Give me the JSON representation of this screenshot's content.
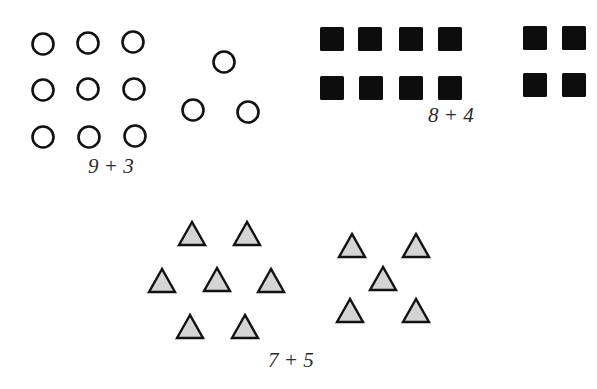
{
  "figure": {
    "groups": [
      {
        "id": "circles",
        "label": "9 + 3",
        "shape": "circle",
        "counts": [
          9,
          3
        ],
        "label_pos": [
          88,
          155
        ]
      },
      {
        "id": "squares",
        "label": "8 + 4",
        "shape": "square",
        "counts": [
          8,
          4
        ],
        "label_pos": [
          428,
          106
        ]
      },
      {
        "id": "triangles",
        "label": "7 + 5",
        "shape": "triangle",
        "counts": [
          7,
          5
        ],
        "label_pos": [
          268,
          350
        ]
      }
    ],
    "colors": {
      "stroke": "#111111",
      "square_fill": "#0d0d0d",
      "triangle_fill": "#d4d4d4",
      "background": "#ffffff"
    },
    "circles": [
      [
        43,
        44
      ],
      [
        88,
        43
      ],
      [
        133,
        42
      ],
      [
        43,
        90
      ],
      [
        88,
        89
      ],
      [
        134,
        89
      ],
      [
        43,
        137
      ],
      [
        89,
        137
      ],
      [
        135,
        136
      ],
      [
        224,
        62
      ],
      [
        193,
        110
      ],
      [
        248,
        112
      ]
    ],
    "squares": [
      [
        320,
        27
      ],
      [
        358,
        27
      ],
      [
        399,
        27
      ],
      [
        438,
        27
      ],
      [
        320,
        76
      ],
      [
        359,
        76
      ],
      [
        399,
        76
      ],
      [
        438,
        76
      ],
      [
        523,
        26
      ],
      [
        562,
        26
      ],
      [
        523,
        73
      ],
      [
        562,
        73
      ]
    ],
    "triangles": [
      [
        192,
        222
      ],
      [
        247,
        222
      ],
      [
        162,
        269
      ],
      [
        217,
        268
      ],
      [
        271,
        269
      ],
      [
        190,
        315
      ],
      [
        245,
        315
      ],
      [
        352,
        234
      ],
      [
        416,
        234
      ],
      [
        383,
        267
      ],
      [
        350,
        299
      ],
      [
        416,
        299
      ]
    ]
  }
}
